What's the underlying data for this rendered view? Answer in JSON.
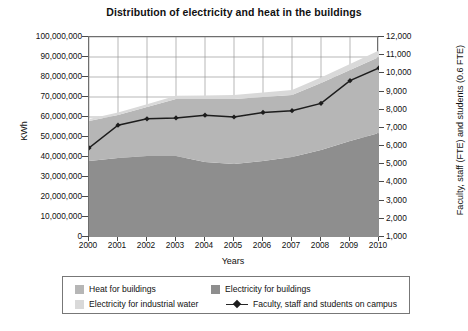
{
  "chart_data": {
    "type": "area",
    "title": "Distribution of electricity and heat in the buildings",
    "xlabel": "Years",
    "ylabel": "KWh",
    "y2label": "Faculty, staff (FTE) and students (0.6 FTE)",
    "grid": true,
    "legend_position": "bottom",
    "categories": [
      "2000",
      "2001",
      "2002",
      "2003",
      "2004",
      "2005",
      "2006",
      "2007",
      "2008",
      "2009",
      "2010"
    ],
    "ylim": [
      0,
      100000000
    ],
    "yticks": [
      "0",
      "10,000,000",
      "20,000,000",
      "30,000,000",
      "40,000,000",
      "50,000,000",
      "60,000,000",
      "70,000,000",
      "80,000,000",
      "90,000,000",
      "100,000,000"
    ],
    "ytick_values": [
      0,
      10000000,
      20000000,
      30000000,
      40000000,
      50000000,
      60000000,
      70000000,
      80000000,
      90000000,
      100000000
    ],
    "y2lim": [
      1000,
      12000
    ],
    "y2ticks": [
      "1,000",
      "2,000",
      "3,000",
      "4,000",
      "5,000",
      "6,000",
      "7,000",
      "8,000",
      "9,000",
      "10,000",
      "11,000",
      "12,000"
    ],
    "y2tick_values": [
      1000,
      2000,
      3000,
      4000,
      5000,
      6000,
      7000,
      8000,
      9000,
      10000,
      11000,
      12000
    ],
    "stacked": true,
    "series": [
      {
        "name": "Electricity for buildings",
        "kind": "area",
        "color": "#8e8e8e",
        "axis": "left",
        "values": [
          38000000,
          39500000,
          40500000,
          40500000,
          37500000,
          36500000,
          38000000,
          40000000,
          43500000,
          48000000,
          52000000
        ]
      },
      {
        "name": "Heat for buildings",
        "kind": "area",
        "color": "#b6b6b6",
        "axis": "left",
        "values": [
          20000000,
          21500000,
          24500000,
          28500000,
          31500000,
          32500000,
          32000000,
          31000000,
          33500000,
          35500000,
          38000000
        ]
      },
      {
        "name": "Electricity for industrial water",
        "kind": "area",
        "color": "#d9d9d9",
        "axis": "left",
        "values": [
          1000000,
          1200000,
          1400000,
          1600000,
          1800000,
          2000000,
          2200000,
          2500000,
          2800000,
          3000000,
          3200000
        ]
      },
      {
        "name": "Faculty, staff and students on campus",
        "kind": "line",
        "color": "#1d1d1d",
        "marker": "diamond",
        "axis": "right",
        "values": [
          5900,
          7150,
          7500,
          7550,
          7700,
          7600,
          7850,
          7950,
          8350,
          9600,
          10300
        ]
      }
    ],
    "series_totals_top": [
      59000000,
      62200000,
      66400000,
      70600000,
      70800000,
      71000000,
      72200000,
      73500000,
      79800000,
      86500000,
      93200000
    ]
  },
  "legend": {
    "items": [
      {
        "label": "Heat for buildings",
        "swatch": "#b6b6b6",
        "type": "swatch"
      },
      {
        "label": "Electricity for buildings",
        "swatch": "#8e8e8e",
        "type": "swatch"
      },
      {
        "label": "Electricity for industrial water",
        "swatch": "#d9d9d9",
        "type": "swatch"
      },
      {
        "label": "Faculty, staff and students on campus",
        "swatch": "#1d1d1d",
        "type": "line-marker"
      }
    ]
  }
}
